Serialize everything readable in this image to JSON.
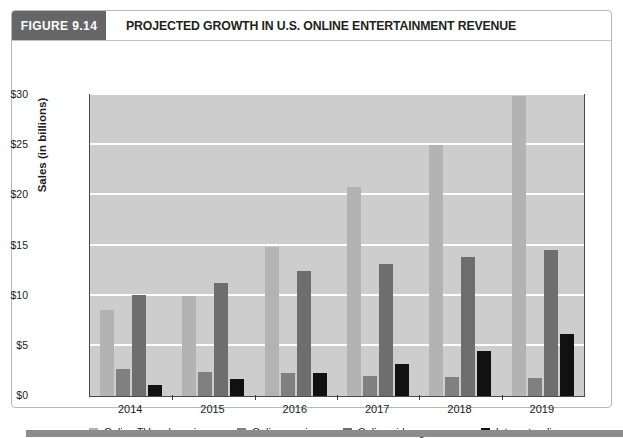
{
  "figure": {
    "number_label": "FIGURE 9.14",
    "title": "PROJECTED GROWTH IN U.S. ONLINE ENTERTAINMENT REVENUE"
  },
  "colors": {
    "header_number_bg": "#666666",
    "plot_background": "#cdcdcd",
    "gridline": "#ffffff",
    "online_tv_and_movies": "#b3b3b3",
    "online_music": "#808080",
    "online_video_games": "#6e6e6e",
    "internet_radio": "#111111",
    "footer_rule": "#8c8c8c"
  },
  "chart_data": {
    "type": "bar",
    "title": "PROJECTED GROWTH IN U.S. ONLINE ENTERTAINMENT REVENUE",
    "xlabel": "",
    "ylabel": "Sales (in billions)",
    "categories": [
      "2014",
      "2015",
      "2016",
      "2017",
      "2018",
      "2019"
    ],
    "ylim": [
      0,
      30
    ],
    "ytick_labels": [
      "$0",
      "$5",
      "$10",
      "$15",
      "$20",
      "$25",
      "$30"
    ],
    "ytick_values": [
      0,
      5,
      10,
      15,
      20,
      25,
      30
    ],
    "grid": true,
    "legend_position": "bottom",
    "series": [
      {
        "name": "Online TV and movies",
        "color": "#b3b3b3",
        "values": [
          8.6,
          10.0,
          14.9,
          20.8,
          25.0,
          29.9
        ]
      },
      {
        "name": "Online music",
        "color": "#808080",
        "values": [
          2.7,
          2.4,
          2.3,
          2.0,
          1.9,
          1.8
        ]
      },
      {
        "name": "Online video games",
        "color": "#6e6e6e",
        "values": [
          10.1,
          11.3,
          12.5,
          13.2,
          13.9,
          14.6
        ]
      },
      {
        "name": "Internet radio",
        "color": "#111111",
        "values": [
          1.1,
          1.7,
          2.3,
          3.2,
          4.5,
          6.2
        ]
      }
    ]
  }
}
